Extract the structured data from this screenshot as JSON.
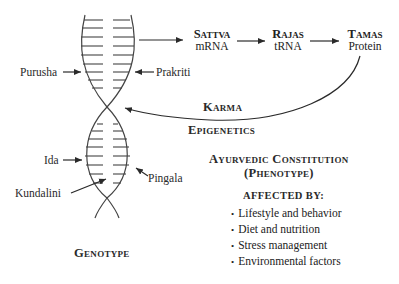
{
  "diagram": {
    "pathway": [
      {
        "title": "Sattva",
        "sub": "mRNA"
      },
      {
        "title": "Rajas",
        "sub": "tRNA"
      },
      {
        "title": "Tamas",
        "sub": "Protein"
      }
    ],
    "helix_labels": {
      "purusha": "Purusha",
      "prakriti": "Prakriti",
      "ida": "Ida",
      "pingala": "Pingala",
      "kundalini": "Kundalini"
    },
    "feedback": {
      "karma": "Karma",
      "epigenetics": "Epigenetics"
    },
    "genotype_label": "Genotype",
    "phenotype": {
      "title": "Ayurvedic Constitution",
      "subtitle": "(Phenotype)",
      "affected_by": "Affected by:",
      "factors": [
        "Lifestyle and behavior",
        "Diet and nutrition",
        "Stress management",
        "Environmental factors"
      ]
    },
    "colors": {
      "ink": "#2a2a2a",
      "background": "#ffffff"
    }
  }
}
